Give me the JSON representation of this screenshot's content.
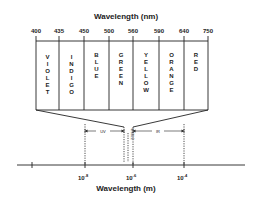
{
  "top_axis": {
    "title": "Wavelength (nm)",
    "ticks": [
      "400",
      "435",
      "450",
      "500",
      "560",
      "590",
      "640",
      "750"
    ]
  },
  "bands": [
    {
      "name": "VIOLET",
      "letters": [
        "V",
        "I",
        "O",
        "L",
        "E",
        "T"
      ]
    },
    {
      "name": "INDIGO",
      "letters": [
        "I",
        "N",
        "D",
        "I",
        "G",
        "O"
      ]
    },
    {
      "name": "BLUE",
      "letters": [
        "B",
        "L",
        "U",
        "E"
      ]
    },
    {
      "name": "GREEN",
      "letters": [
        "G",
        "R",
        "E",
        "E",
        "N"
      ]
    },
    {
      "name": "YELLOW",
      "letters": [
        "Y",
        "E",
        "L",
        "L",
        "O",
        "W"
      ]
    },
    {
      "name": "ORANGE",
      "letters": [
        "O",
        "R",
        "A",
        "N",
        "G",
        "E"
      ]
    },
    {
      "name": "RED",
      "letters": [
        "R",
        "E",
        "D"
      ]
    }
  ],
  "regions": {
    "uv": "UV",
    "ir": "IR",
    "visible": "VISIBLE"
  },
  "bottom_axis": {
    "title": "Wavelength (m)",
    "ticks": [
      {
        "base": "10",
        "exp": "-8"
      },
      {
        "base": "10",
        "exp": "-6"
      },
      {
        "base": "10",
        "exp": "-4"
      }
    ]
  },
  "colors": {
    "line": "#222222",
    "background": "#ffffff"
  }
}
